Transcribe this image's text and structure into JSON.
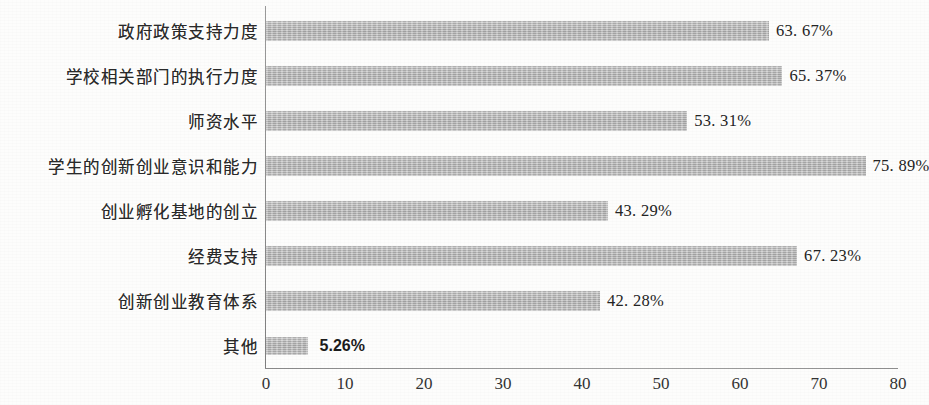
{
  "chart_data": {
    "type": "bar",
    "orientation": "horizontal",
    "title": "",
    "subtitle": "",
    "xlabel": "",
    "ylabel": "",
    "xlim": [
      0,
      80
    ],
    "xticks": [
      "0",
      "10",
      "20",
      "30",
      "40",
      "50",
      "60",
      "70",
      "80"
    ],
    "grid": false,
    "legend": null,
    "bar_color": "#b6b6b6",
    "background_color": "#fdfdfc",
    "axis_color": "#8d8d8d",
    "categories": [
      "政府政策支持力度",
      "学校相关部门的执行力度",
      "师资水平",
      "学生的创新创业意识和能力",
      "创业孵化基地的创立",
      "经费支持",
      "创新创业教育体系",
      "其他"
    ],
    "values": [
      63.67,
      65.37,
      53.31,
      75.89,
      43.29,
      67.23,
      42.28,
      5.26
    ],
    "data_labels": [
      "63. 67%",
      "65. 37%",
      "53. 31%",
      "75. 89%",
      "43. 29%",
      "67. 23%",
      "42. 28%",
      "5.26%"
    ],
    "bars": [
      {
        "category": "政府政策支持力度",
        "value": 63.67,
        "label": "63. 67%",
        "emphasis": false
      },
      {
        "category": "学校相关部门的执行力度",
        "value": 65.37,
        "label": "65. 37%",
        "emphasis": false
      },
      {
        "category": "师资水平",
        "value": 53.31,
        "label": "53. 31%",
        "emphasis": false
      },
      {
        "category": "学生的创新创业意识和能力",
        "value": 75.89,
        "label": "75. 89%",
        "emphasis": false
      },
      {
        "category": "创业孵化基地的创立",
        "value": 43.29,
        "label": "43. 29%",
        "emphasis": false
      },
      {
        "category": "经费支持",
        "value": 67.23,
        "label": "67. 23%",
        "emphasis": false
      },
      {
        "category": "创新创业教育体系",
        "value": 42.28,
        "label": "42. 28%",
        "emphasis": false
      },
      {
        "category": "其他",
        "value": 5.26,
        "label": "5.26%",
        "emphasis": true
      }
    ]
  }
}
